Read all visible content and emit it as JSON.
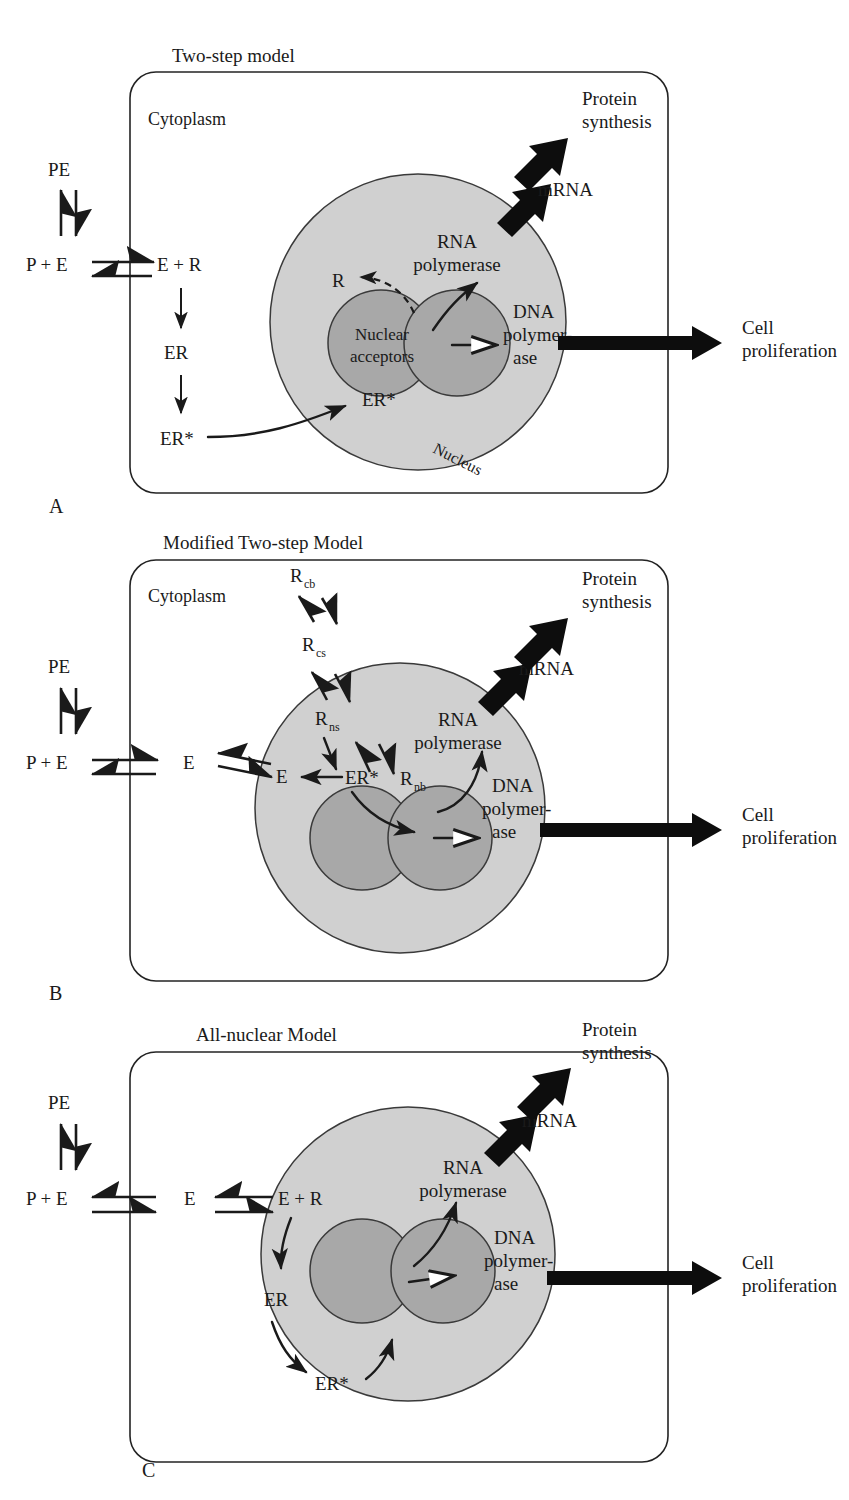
{
  "figure": {
    "caption_letters": [
      "A",
      "B",
      "C"
    ],
    "colors": {
      "nucleus_fill": "#d0d0d0",
      "acceptor_fill": "#a8a8a8",
      "outline": "#232323",
      "text": "#1a1a1a",
      "arrow": "#0d0d0d"
    }
  },
  "panels": [
    {
      "letter": "A",
      "title": "Two-step model",
      "compartment_label": "Cytoplasm",
      "nucleus_label": "Nucleus",
      "acceptor_label_line1": "Nuclear",
      "acceptor_label_line2": "acceptors",
      "outputs": {
        "mrna": "mRNA",
        "protein_line1": "Protein",
        "protein_line2": "synthesis",
        "cell_line1": "Cell",
        "cell_line2": "proliferation"
      },
      "enzymes": {
        "rna_line1": "RNA",
        "rna_line2": "polymerase",
        "dna_line1": "DNA",
        "dna_line2": "polymer-",
        "dna_line3": "ase"
      },
      "species": {
        "pe": "PE",
        "p_plus_e": "P + E",
        "e_plus_r": "E + R",
        "er": "ER",
        "er_star": "ER*",
        "er_star_nuclear": "ER*",
        "r_released": "R"
      }
    },
    {
      "letter": "B",
      "title": "Modified Two-step Model",
      "compartment_label": "Cytoplasm",
      "outputs": {
        "mrna": "mRNA",
        "protein_line1": "Protein",
        "protein_line2": "synthesis",
        "cell_line1": "Cell",
        "cell_line2": "proliferation"
      },
      "enzymes": {
        "rna_line1": "RNA",
        "rna_line2": "polymerase",
        "dna_line1": "DNA",
        "dna_line2": "polymer-",
        "dna_line3": "ase"
      },
      "species": {
        "pe": "PE",
        "p_plus_e": "P + E",
        "e_cytoplasm": "E",
        "e_nuclear": "E",
        "er_star": "ER*"
      },
      "receptor_pools": [
        {
          "base": "R",
          "sub": "cb"
        },
        {
          "base": "R",
          "sub": "cs"
        },
        {
          "base": "R",
          "sub": "ns"
        },
        {
          "base": "R",
          "sub": "nb"
        }
      ]
    },
    {
      "letter": "C",
      "title": "All-nuclear Model",
      "outputs": {
        "mrna": "mRNA",
        "protein_line1": "Protein",
        "protein_line2": "synthesis",
        "cell_line1": "Cell",
        "cell_line2": "proliferation"
      },
      "enzymes": {
        "rna_line1": "RNA",
        "rna_line2": "polymerase",
        "dna_line1": "DNA",
        "dna_line2": "polymer-",
        "dna_line3": "ase"
      },
      "species": {
        "pe": "PE",
        "p_plus_e": "P + E",
        "e_cytoplasm": "E",
        "e_plus_r": "E + R",
        "er": "ER",
        "er_star": "ER*"
      }
    }
  ]
}
